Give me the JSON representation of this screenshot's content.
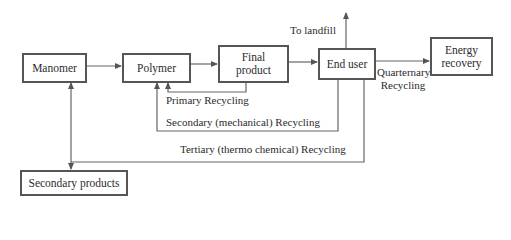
{
  "diagram": {
    "type": "flowchart",
    "nodes": [
      {
        "id": "manomer",
        "label": "Manomer"
      },
      {
        "id": "polymer",
        "label": "Polymer"
      },
      {
        "id": "final_product",
        "label": "Final product",
        "lines": [
          "Final",
          "product"
        ]
      },
      {
        "id": "end_user",
        "label": "End user"
      },
      {
        "id": "energy_recovery",
        "label": "Energy recovery",
        "lines": [
          "Energy",
          "recovery"
        ]
      },
      {
        "id": "secondary_products",
        "label": "Secondary products"
      }
    ],
    "edges": [
      {
        "from": "manomer",
        "to": "polymer",
        "label": ""
      },
      {
        "from": "polymer",
        "to": "final_product",
        "label": ""
      },
      {
        "from": "final_product",
        "to": "end_user",
        "label": ""
      },
      {
        "from": "end_user",
        "to": "landfill",
        "label": "To landfill"
      },
      {
        "from": "end_user",
        "to": "energy_recovery",
        "label": "Quarternary Recycling"
      },
      {
        "from": "final_product",
        "to": "polymer",
        "label": "Primary Recycling"
      },
      {
        "from": "end_user",
        "to": "polymer",
        "label": "Secondary (mechanical) Recycling"
      },
      {
        "from": "end_user",
        "to": "manomer",
        "label": "Tertiary (thermo chemical) Recycling"
      },
      {
        "from": "end_user",
        "to": "secondary_products",
        "label": "Tertiary (thermo chemical) Recycling"
      }
    ]
  },
  "labels": {
    "manomer": "Manomer",
    "polymer": "Polymer",
    "final_product_line1": "Final",
    "final_product_line2": "product",
    "end_user": "End user",
    "energy_line1": "Energy",
    "energy_line2": "recovery",
    "secondary_products": "Secondary products",
    "to_landfill": "To landfill",
    "quarternary_line1": "Quarternary",
    "quarternary_line2": "Recycling",
    "primary_recycling": "Primary Recycling",
    "secondary_recycling": "Secondary (mechanical) Recycling",
    "tertiary_recycling": "Tertiary (thermo chemical) Recycling"
  },
  "colors": {
    "line": "#555555",
    "text": "#2b2b2b",
    "background": "#ffffff"
  }
}
